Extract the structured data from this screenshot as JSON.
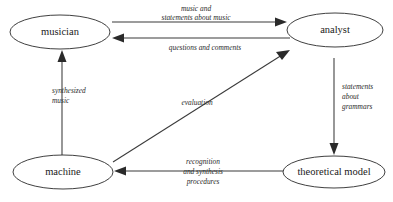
{
  "diagram": {
    "background_color": "#ffffff",
    "stroke_color": "#2a2a2a",
    "text_color": "#1a1a1a",
    "nodes": [
      {
        "id": "musician",
        "label": "musician",
        "cx": 60,
        "cy": 32,
        "rx": 50,
        "ry": 17
      },
      {
        "id": "analyst",
        "label": "analyst",
        "cx": 335,
        "cy": 30,
        "rx": 48,
        "ry": 17
      },
      {
        "id": "machine",
        "label": "machine",
        "cx": 63,
        "cy": 172,
        "rx": 50,
        "ry": 17
      },
      {
        "id": "theoretical-model",
        "label": "theoretical model",
        "cx": 334,
        "cy": 172,
        "rx": 51,
        "ry": 16
      }
    ],
    "edges": [
      {
        "id": "musician-to-analyst",
        "from": "musician",
        "to": "analyst",
        "direction": "right",
        "lines": [
          "music and",
          "statements about music"
        ]
      },
      {
        "id": "analyst-to-musician",
        "from": "analyst",
        "to": "musician",
        "direction": "left",
        "lines": [
          "questions and comments"
        ]
      },
      {
        "id": "analyst-to-theoretical-model",
        "from": "analyst",
        "to": "theoretical-model",
        "direction": "down",
        "lines": [
          "statements",
          "about",
          "grammars"
        ]
      },
      {
        "id": "theoretical-model-to-machine",
        "from": "theoretical-model",
        "to": "machine",
        "direction": "left",
        "lines": [
          "recognition",
          "and synthesis",
          "procedures"
        ]
      },
      {
        "id": "machine-to-musician",
        "from": "machine",
        "to": "musician",
        "direction": "up",
        "lines": [
          "synthesized",
          "music"
        ]
      },
      {
        "id": "machine-to-analyst",
        "from": "machine",
        "to": "analyst",
        "direction": "diagonal-up-right",
        "lines": [
          "evaluation"
        ]
      }
    ]
  }
}
